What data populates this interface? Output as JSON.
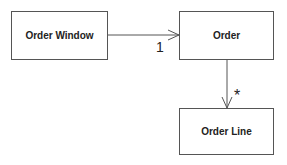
{
  "diagram": {
    "classes": [
      {
        "id": "order-window",
        "name": "Order Window"
      },
      {
        "id": "order",
        "name": "Order"
      },
      {
        "id": "order-line",
        "name": "Order Line"
      }
    ],
    "associations": [
      {
        "from": "order-window",
        "to": "order",
        "multiplicity": "1",
        "navigable": true
      },
      {
        "from": "order",
        "to": "order-line",
        "multiplicity": "*",
        "navigable": true
      }
    ]
  },
  "colors": {
    "line": "#555555",
    "text": "#222222"
  }
}
